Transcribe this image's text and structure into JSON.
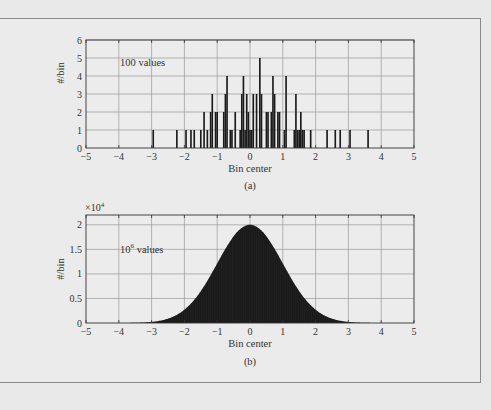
{
  "figure": {
    "background_color": "#e9e9e9",
    "panel_color": "#ebebeb",
    "bar_color": "#1a1a1a",
    "grid_color": "#9a9a9a"
  },
  "chart_data": [
    {
      "type": "bar",
      "panel_label": "(a)",
      "annotation": "100 values",
      "xlabel": "Bin center",
      "ylabel": "#/bin",
      "xlim": [
        -5,
        5
      ],
      "ylim": [
        0,
        6
      ],
      "xticks": [
        "-5",
        "-4",
        "-3",
        "-2",
        "-1",
        "0",
        "1",
        "2",
        "3",
        "4",
        "5"
      ],
      "yticks": [
        "0",
        "1",
        "2",
        "3",
        "4",
        "5",
        "6"
      ],
      "grid": true,
      "bin_width": 0.05,
      "x": [
        -2.95,
        -2.23,
        -1.95,
        -1.8,
        -1.7,
        -1.5,
        -1.4,
        -1.3,
        -1.2,
        -1.15,
        -1.05,
        -1.0,
        -0.8,
        -0.75,
        -0.7,
        -0.6,
        -0.55,
        -0.45,
        -0.3,
        -0.25,
        -0.2,
        -0.15,
        -0.1,
        -0.05,
        0.0,
        0.05,
        0.1,
        0.2,
        0.3,
        0.35,
        0.5,
        0.55,
        0.65,
        0.7,
        0.75,
        0.85,
        0.9,
        1.05,
        1.1,
        1.35,
        1.4,
        1.45,
        1.5,
        1.55,
        1.6,
        1.65,
        1.85,
        2.35,
        2.6,
        2.75,
        3.05,
        3.6
      ],
      "values": [
        1,
        1,
        1,
        1,
        1,
        1,
        2,
        1,
        2,
        3,
        2,
        2,
        2,
        3,
        4,
        1,
        1,
        2,
        1,
        3,
        4,
        1,
        3,
        2,
        1,
        1,
        3,
        3,
        5,
        3,
        2,
        2,
        2,
        4,
        3,
        2,
        2,
        1,
        4,
        1,
        3,
        1,
        1,
        2,
        1,
        1,
        1,
        1,
        1,
        1,
        1,
        1
      ]
    },
    {
      "type": "bar",
      "panel_label": "(b)",
      "annotation": "10⁶ values",
      "annotation_base": "10",
      "annotation_exp": "6",
      "annotation_rest": " values",
      "xlabel": "Bin center",
      "ylabel": "#/bin",
      "y_multiplier": "×10⁴",
      "y_multiplier_base": "×10",
      "y_multiplier_exp": "4",
      "xlim": [
        -5,
        5
      ],
      "ylim": [
        0,
        2.2
      ],
      "xticks": [
        "-5",
        "-4",
        "-3",
        "-2",
        "-1",
        "0",
        "1",
        "2",
        "3",
        "4",
        "5"
      ],
      "yticks": [
        "0",
        "0.5",
        "1",
        "1.5",
        "2"
      ],
      "ytick_values": [
        0,
        0.5,
        1,
        1.5,
        2
      ],
      "grid": true,
      "distribution": "gaussian",
      "mean": 0,
      "std": 1,
      "peak_value": 2.0,
      "peak_units": "×10⁴ per bin"
    }
  ]
}
